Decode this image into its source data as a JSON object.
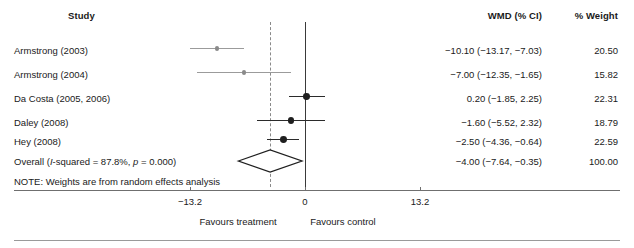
{
  "chart_data": {
    "type": "forest",
    "title": "",
    "columns": {
      "study": "Study",
      "effect": "WMD (% CI)",
      "weight": "% Weight"
    },
    "studies": [
      {
        "label": "Armstrong (2003)",
        "estimate": -10.1,
        "ci_low": -13.17,
        "ci_high": -7.03,
        "effect_text": "−10.10 (−13.17, −7.03)",
        "weight": 20.5,
        "weight_text": "20.50",
        "style": "light"
      },
      {
        "label": "Armstrong (2004)",
        "estimate": -7.0,
        "ci_low": -12.35,
        "ci_high": -1.65,
        "effect_text": "−7.00 (−12.35, −1.65)",
        "weight": 15.82,
        "weight_text": "15.82",
        "style": "light"
      },
      {
        "label": "Da Costa (2005, 2006)",
        "estimate": 0.2,
        "ci_low": -1.85,
        "ci_high": 2.25,
        "effect_text": "0.20 (−1.85, 2.25)",
        "weight": 22.31,
        "weight_text": "22.31",
        "style": "dark"
      },
      {
        "label": "Daley (2008)",
        "estimate": -1.6,
        "ci_low": -5.52,
        "ci_high": 2.32,
        "effect_text": "−1.60 (−5.52, 2.32)",
        "weight": 18.79,
        "weight_text": "18.79",
        "style": "dark"
      },
      {
        "label": "Hey (2008)",
        "estimate": -2.5,
        "ci_low": -4.36,
        "ci_high": -0.64,
        "effect_text": "−2.50 (−4.36, −0.64)",
        "weight": 22.59,
        "weight_text": "22.59",
        "style": "dark"
      }
    ],
    "overall": {
      "label_prefix": "Overall (",
      "label_i": "I",
      "label_mid": "-squared = 87.8%, ",
      "label_p": "p",
      "label_suffix": " = 0.000)",
      "i_squared": "87.8%",
      "p_value": "0.000",
      "estimate": -4.0,
      "ci_low": -7.64,
      "ci_high": -0.35,
      "effect_text": "−4.00 (−7.64, −0.35)",
      "weight": 100.0,
      "weight_text": "100.00"
    },
    "note": "NOTE: Weights are from random effects analysis",
    "axis": {
      "ticks": [
        -13.2,
        0,
        13.2
      ],
      "tick_labels": [
        "−13.2",
        "0",
        "13.2"
      ],
      "xlim": [
        -13.2,
        13.2
      ],
      "null_value": 0,
      "left_annotation": "Favours treatment",
      "right_annotation": "Favours control"
    },
    "colors": {
      "light_series": "#9b9b9b",
      "dark_series": "#2b2b2b",
      "null_line": "#3a3a3a",
      "pooled_line": "#8a8a8a",
      "axis": "#6f6f6f",
      "text": "#1a1a1a"
    }
  }
}
